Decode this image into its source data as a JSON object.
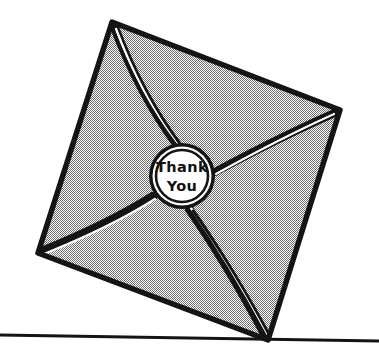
{
  "canvas": {
    "width": 379,
    "height": 361,
    "background_color": "#ffffff"
  },
  "illustration": {
    "subject": "thank-you-envelope",
    "description": "A sealed envelope tilted at an angle, balancing on one corner atop a horizontal ground line, with a round wax-style seal in the center.",
    "style": "black-and-white line art with dithered gray halftone fill",
    "line_color": "#141414",
    "fill_color": "#9a9a9a",
    "seal_fill_color": "#ffffff"
  },
  "seal": {
    "name": "thank-you-seal",
    "line_1": "Thank",
    "line_2": "You",
    "center_x": 182,
    "center_y": 176,
    "radius": 33,
    "ring_color": "#141414",
    "face_color": "#ffffff",
    "text_color": "#111111"
  },
  "envelope": {
    "name": "envelope-body",
    "corners": {
      "top": [
        112,
        22
      ],
      "right": [
        340,
        110
      ],
      "bottom": [
        268,
        340
      ],
      "left": [
        38,
        253
      ]
    },
    "center": [
      182,
      176
    ],
    "flap_seams": [
      "top-to-center",
      "right-to-center",
      "bottom-to-center",
      "left-to-center"
    ]
  },
  "ground": {
    "name": "ground-line",
    "start": [
      0,
      335
    ],
    "end": [
      379,
      341
    ],
    "color": "#141414",
    "thickness": 3
  }
}
